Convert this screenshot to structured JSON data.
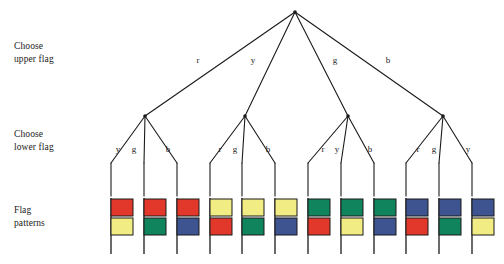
{
  "diagram": {
    "row_labels": [
      {
        "name": "choose-upper-flag",
        "line1": "Choose",
        "line2": "upper flag"
      },
      {
        "name": "choose-lower-flag",
        "line1": "Choose",
        "line2": "lower flag"
      },
      {
        "name": "flag-patterns",
        "line1": "Flag",
        "line2": "patterns"
      }
    ],
    "colors": {
      "red": "#E2382B",
      "yellow": "#F2EC84",
      "green": "#10845C",
      "blue": "#3D5490",
      "stroke": "#1a1a1a",
      "pole": "#2b2b2b",
      "background": "#ffffff"
    },
    "root": {
      "name": "root-node",
      "x": 295,
      "y": 12
    },
    "level1_edges": [
      {
        "label": "r",
        "label_x": 198,
        "label_y": 63,
        "to_x": 145,
        "to_y": 116
      },
      {
        "label": "y",
        "label_x": 253,
        "label_y": 63,
        "to_x": 245,
        "to_y": 116
      },
      {
        "label": "g",
        "label_x": 335,
        "label_y": 63,
        "to_x": 348,
        "to_y": 116
      },
      {
        "label": "b",
        "label_x": 388,
        "label_y": 63,
        "to_x": 443,
        "to_y": 116
      }
    ],
    "level2_groups": [
      {
        "parent": "r",
        "node_x": 145,
        "edges": [
          {
            "label": "y",
            "label_x": 118,
            "label_y": 152,
            "leaf_x": 111
          },
          {
            "label": "g",
            "label_x": 134,
            "label_y": 152,
            "leaf_x": 144
          },
          {
            "label": "b",
            "label_x": 168,
            "label_y": 152,
            "leaf_x": 177
          }
        ]
      },
      {
        "parent": "y",
        "node_x": 245,
        "edges": [
          {
            "label": "r",
            "label_x": 220,
            "label_y": 152,
            "leaf_x": 210
          },
          {
            "label": "g",
            "label_x": 235,
            "label_y": 152,
            "leaf_x": 242
          },
          {
            "label": "b",
            "label_x": 268,
            "label_y": 152,
            "leaf_x": 275
          }
        ]
      },
      {
        "parent": "g",
        "node_x": 348,
        "edges": [
          {
            "label": "r",
            "label_x": 323,
            "label_y": 152,
            "leaf_x": 308
          },
          {
            "label": "y",
            "label_x": 337,
            "label_y": 152,
            "leaf_x": 341
          },
          {
            "label": "b",
            "label_x": 370,
            "label_y": 152,
            "leaf_x": 374
          }
        ]
      },
      {
        "parent": "b",
        "node_x": 443,
        "edges": [
          {
            "label": "r",
            "label_x": 418,
            "label_y": 152,
            "leaf_x": 406
          },
          {
            "label": "g",
            "label_x": 434,
            "label_y": 152,
            "leaf_x": 439
          },
          {
            "label": "y",
            "label_x": 468,
            "label_y": 152,
            "leaf_x": 472
          }
        ]
      }
    ],
    "flags": [
      {
        "index": 1,
        "pole_x": 111,
        "upper": "red",
        "lower": "yellow"
      },
      {
        "index": 2,
        "pole_x": 144,
        "upper": "red",
        "lower": "green"
      },
      {
        "index": 3,
        "pole_x": 177,
        "upper": "red",
        "lower": "blue"
      },
      {
        "index": 4,
        "pole_x": 210,
        "upper": "yellow",
        "lower": "red"
      },
      {
        "index": 5,
        "pole_x": 242,
        "upper": "yellow",
        "lower": "green"
      },
      {
        "index": 6,
        "pole_x": 275,
        "upper": "yellow",
        "lower": "blue"
      },
      {
        "index": 7,
        "pole_x": 308,
        "upper": "green",
        "lower": "red"
      },
      {
        "index": 8,
        "pole_x": 341,
        "upper": "green",
        "lower": "yellow"
      },
      {
        "index": 9,
        "pole_x": 374,
        "upper": "green",
        "lower": "blue"
      },
      {
        "index": 10,
        "pole_x": 406,
        "upper": "blue",
        "lower": "red"
      },
      {
        "index": 11,
        "pole_x": 439,
        "upper": "blue",
        "lower": "green"
      },
      {
        "index": 12,
        "pole_x": 472,
        "upper": "blue",
        "lower": "yellow"
      }
    ],
    "geometry": {
      "leaf_line_top": 163,
      "leaf_line_bottom": 196,
      "flag_top": 199,
      "flag_width": 22,
      "flag_height": 17,
      "flag_gap": 2,
      "pole_bottom": 254
    }
  }
}
